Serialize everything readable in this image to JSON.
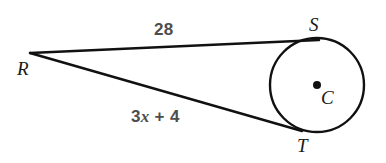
{
  "figure": {
    "background_color": "#ffffff",
    "stroke_color": "#111111",
    "label_color": "#1a1a1a",
    "measure_color": "#4d4d4d"
  },
  "points": {
    "R": {
      "label": "R",
      "x": 30,
      "y": 53,
      "role": "external-point"
    },
    "S": {
      "label": "S",
      "x": 318,
      "y": 40,
      "role": "tangent-point-upper"
    },
    "T": {
      "label": "T",
      "x": 301,
      "y": 130,
      "role": "tangent-point-lower"
    },
    "C": {
      "label": "C",
      "x": 317,
      "y": 85,
      "role": "circle-center"
    }
  },
  "circle": {
    "center_x": 317,
    "center_y": 85,
    "radius": 47,
    "center_dot_radius": 4
  },
  "segments": [
    {
      "name": "RS",
      "from": "R",
      "to": "S",
      "measure_label": "28",
      "label_x": 154,
      "label_y": 21
    },
    {
      "name": "RT",
      "from": "R",
      "to": "T",
      "measure_label_parts": {
        "coefficient": "3",
        "variable": "x",
        "operator": "+",
        "constant": "4"
      },
      "measure_label": "3x + 4",
      "label_x": 131,
      "label_y": 108
    }
  ]
}
